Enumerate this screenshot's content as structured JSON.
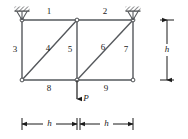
{
  "figure": {
    "type": "truss-diagram",
    "title": "",
    "colors": {
      "member": "#55585c",
      "outline": "#3a3d41",
      "text": "#1a1a1a",
      "background": "#ffffff",
      "hatch": "#2b2d30"
    },
    "members": [
      {
        "id": "1",
        "label": "1",
        "kind": "top-chord",
        "from": "top-left",
        "to": "top-mid"
      },
      {
        "id": "2",
        "label": "2",
        "kind": "top-chord",
        "from": "top-mid",
        "to": "top-right"
      },
      {
        "id": "3",
        "label": "3",
        "kind": "vertical",
        "from": "top-left",
        "to": "bottom-left"
      },
      {
        "id": "4",
        "label": "4",
        "kind": "diagonal",
        "from": "bottom-left",
        "to": "top-mid"
      },
      {
        "id": "5",
        "label": "5",
        "kind": "vertical",
        "from": "top-mid",
        "to": "bottom-mid"
      },
      {
        "id": "6",
        "label": "6",
        "kind": "diagonal",
        "from": "bottom-mid",
        "to": "top-right"
      },
      {
        "id": "7",
        "label": "7",
        "kind": "vertical",
        "from": "top-right",
        "to": "bottom-right"
      },
      {
        "id": "8",
        "label": "8",
        "kind": "bottom-chord",
        "from": "bottom-left",
        "to": "bottom-mid"
      },
      {
        "id": "9",
        "label": "9",
        "kind": "bottom-chord",
        "from": "bottom-mid",
        "to": "bottom-right"
      }
    ],
    "nodes": [
      {
        "id": "top-left",
        "support": "pin-hatched"
      },
      {
        "id": "top-mid",
        "support": "none"
      },
      {
        "id": "top-right",
        "support": "pin-hatched"
      },
      {
        "id": "bottom-left",
        "support": "none"
      },
      {
        "id": "bottom-mid",
        "support": "none"
      },
      {
        "id": "bottom-right",
        "support": "none"
      }
    ],
    "load": {
      "label": "P",
      "direction": "down",
      "applied_at": "bottom-mid"
    },
    "dimensions": [
      {
        "id": "dim-height",
        "label": "h",
        "orientation": "vertical"
      },
      {
        "id": "dim-span-left",
        "label": "h",
        "orientation": "horizontal"
      },
      {
        "id": "dim-span-right",
        "label": "h",
        "orientation": "horizontal"
      }
    ]
  }
}
